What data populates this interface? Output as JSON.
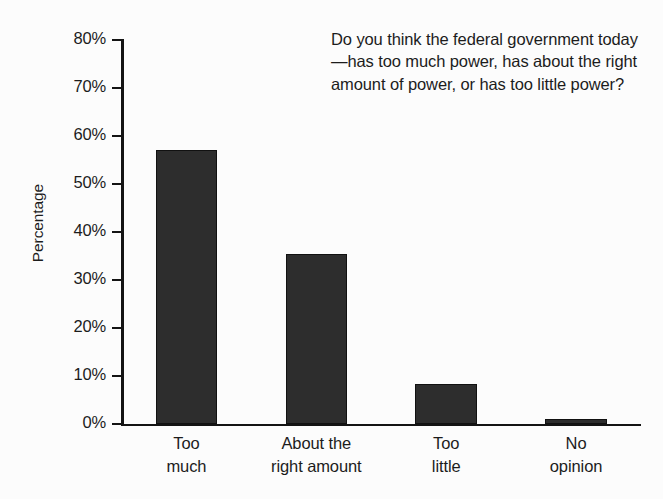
{
  "chart_data": {
    "type": "bar",
    "title": "",
    "annotation": "Do you think the federal government today—has too much power, has about the right amount of power, or has too little power?",
    "categories": [
      "Too much",
      "About the right amount",
      "Too little",
      "No opinion"
    ],
    "category_lines": [
      "Too\nmuch",
      "About the\nright amount",
      "Too\nlittle",
      "No\nopinion"
    ],
    "values": [
      57,
      35.4,
      8.3,
      1
    ],
    "value_labels": [
      "57%",
      "35%",
      "8%",
      "1%"
    ],
    "xlabel": "",
    "ylabel": "Percentage",
    "ylim": [
      0,
      80
    ],
    "y_ticks": [
      0,
      10,
      20,
      30,
      40,
      50,
      60,
      70,
      80
    ],
    "y_tick_labels": [
      "0%",
      "10%",
      "20%",
      "30%",
      "40%",
      "50%",
      "60%",
      "70%",
      "80%"
    ],
    "grid": false,
    "legend": null,
    "bar_color": "#2d2d2d",
    "axis_color": "#141414",
    "background_color": "#fcfcfc"
  }
}
